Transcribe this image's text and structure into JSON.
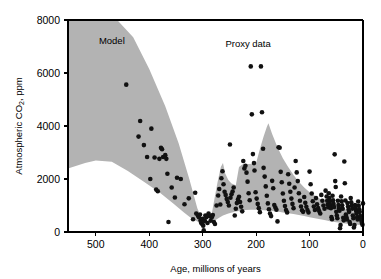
{
  "chart_data": {
    "type": "scatter",
    "title": "",
    "xlabel": "Age, millions of years",
    "ylabel_prefix": "Atmospheric CO",
    "ylabel_sub": "2",
    "ylabel_suffix": ", ppm",
    "ylabel_full": "Atmospheric CO2, ppm",
    "xlim": [
      552,
      0
    ],
    "ylim": [
      0,
      8000
    ],
    "x_reversed": true,
    "grid": false,
    "legend": "none",
    "xticks": [
      500,
      400,
      300,
      200,
      100,
      0
    ],
    "xtick_labels": [
      "500",
      "400",
      "300",
      "200",
      "100",
      "0"
    ],
    "yticks": [
      0,
      2000,
      4000,
      6000,
      8000
    ],
    "ytick_labels": [
      "0",
      "2000",
      "4000",
      "6000",
      "8000"
    ],
    "annotations": [
      {
        "name": "model-label",
        "text": "Model",
        "x": 470,
        "y": 7100
      },
      {
        "name": "proxy-label",
        "text": "Proxy data",
        "x": 215,
        "y": 7000
      }
    ],
    "colors": {
      "band_fill": "#b3b3b3",
      "point_fill": "#111111",
      "axis": "#000000",
      "background": "#ffffff"
    },
    "series": [
      {
        "name": "Model",
        "type": "band",
        "fill": "#b3b3b3",
        "upper": [
          [
            552,
            8000
          ],
          [
            500,
            8000
          ],
          [
            460,
            8000
          ],
          [
            430,
            7350
          ],
          [
            400,
            6150
          ],
          [
            370,
            4750
          ],
          [
            345,
            3350
          ],
          [
            325,
            2000
          ],
          [
            310,
            900
          ],
          [
            300,
            430
          ],
          [
            292,
            330
          ],
          [
            285,
            460
          ],
          [
            278,
            1250
          ],
          [
            272,
            1900
          ],
          [
            266,
            2450
          ],
          [
            262,
            2600
          ],
          [
            258,
            2220
          ],
          [
            252,
            1960
          ],
          [
            246,
            1830
          ],
          [
            238,
            1760
          ],
          [
            232,
            2450
          ],
          [
            226,
            2550
          ],
          [
            220,
            2560
          ],
          [
            214,
            2570
          ],
          [
            208,
            2580
          ],
          [
            200,
            2600
          ],
          [
            192,
            3200
          ],
          [
            186,
            3600
          ],
          [
            180,
            3960
          ],
          [
            177,
            4100
          ],
          [
            170,
            3700
          ],
          [
            160,
            3200
          ],
          [
            150,
            2780
          ],
          [
            140,
            2450
          ],
          [
            130,
            2150
          ],
          [
            120,
            1900
          ],
          [
            110,
            1680
          ],
          [
            100,
            1500
          ],
          [
            90,
            1370
          ],
          [
            80,
            1250
          ],
          [
            70,
            1150
          ],
          [
            60,
            1060
          ],
          [
            50,
            980
          ],
          [
            40,
            900
          ],
          [
            30,
            840
          ],
          [
            20,
            790
          ],
          [
            10,
            740
          ],
          [
            0,
            700
          ]
        ],
        "lower": [
          [
            552,
            2400
          ],
          [
            520,
            2600
          ],
          [
            500,
            2700
          ],
          [
            470,
            2650
          ],
          [
            440,
            2300
          ],
          [
            410,
            1900
          ],
          [
            380,
            1480
          ],
          [
            355,
            1080
          ],
          [
            335,
            740
          ],
          [
            320,
            500
          ],
          [
            310,
            400
          ],
          [
            300,
            330
          ],
          [
            292,
            300
          ],
          [
            285,
            330
          ],
          [
            278,
            420
          ],
          [
            270,
            530
          ],
          [
            262,
            620
          ],
          [
            252,
            700
          ],
          [
            240,
            760
          ],
          [
            230,
            800
          ],
          [
            220,
            830
          ],
          [
            210,
            840
          ],
          [
            200,
            840
          ],
          [
            190,
            830
          ],
          [
            180,
            810
          ],
          [
            170,
            790
          ],
          [
            160,
            770
          ],
          [
            150,
            740
          ],
          [
            140,
            710
          ],
          [
            130,
            680
          ],
          [
            120,
            640
          ],
          [
            110,
            600
          ],
          [
            100,
            560
          ],
          [
            90,
            520
          ],
          [
            80,
            480
          ],
          [
            70,
            440
          ],
          [
            60,
            400
          ],
          [
            50,
            370
          ],
          [
            40,
            340
          ],
          [
            30,
            310
          ],
          [
            20,
            290
          ],
          [
            10,
            270
          ],
          [
            0,
            250
          ]
        ]
      },
      {
        "name": "Proxy data",
        "type": "points",
        "marker": "circle",
        "marker_size": 4.6,
        "color": "#111111",
        "points": [
          [
            443,
            5560
          ],
          [
            417,
            4190
          ],
          [
            420,
            3600
          ],
          [
            410,
            3280
          ],
          [
            404,
            2830
          ],
          [
            398,
            2000
          ],
          [
            396,
            3900
          ],
          [
            390,
            2810
          ],
          [
            387,
            1600
          ],
          [
            384,
            1540
          ],
          [
            381,
            2760
          ],
          [
            378,
            3180
          ],
          [
            376,
            3120
          ],
          [
            374,
            2830
          ],
          [
            370,
            2900
          ],
          [
            368,
            2760
          ],
          [
            366,
            2200
          ],
          [
            364,
            380
          ],
          [
            358,
            1680
          ],
          [
            352,
            1300
          ],
          [
            348,
            2050
          ],
          [
            341,
            2000
          ],
          [
            334,
            1050
          ],
          [
            326,
            1270
          ],
          [
            318,
            480
          ],
          [
            314,
            1480
          ],
          [
            312,
            700
          ],
          [
            309,
            620
          ],
          [
            307,
            560
          ],
          [
            305,
            660
          ],
          [
            304,
            430
          ],
          [
            303,
            350
          ],
          [
            301,
            300
          ],
          [
            300,
            500
          ],
          [
            299,
            240
          ],
          [
            298,
            60
          ],
          [
            296,
            420
          ],
          [
            295,
            620
          ],
          [
            293,
            560
          ],
          [
            291,
            340
          ],
          [
            289,
            700
          ],
          [
            287,
            600
          ],
          [
            285,
            430
          ],
          [
            283,
            560
          ],
          [
            281,
            640
          ],
          [
            279,
            380
          ],
          [
            277,
            300
          ],
          [
            274,
            1000
          ],
          [
            271,
            1380
          ],
          [
            269,
            1620
          ],
          [
            267,
            1040
          ],
          [
            265,
            2030
          ],
          [
            263,
            2290
          ],
          [
            261,
            1800
          ],
          [
            259,
            1520
          ],
          [
            257,
            1400
          ],
          [
            255,
            1250
          ],
          [
            253,
            1130
          ],
          [
            251,
            1000
          ],
          [
            249,
            3300
          ],
          [
            248,
            1290
          ],
          [
            246,
            1420
          ],
          [
            244,
            1530
          ],
          [
            242,
            1680
          ],
          [
            240,
            620
          ],
          [
            238,
            880
          ],
          [
            236,
            1090
          ],
          [
            234,
            1230
          ],
          [
            232,
            1330
          ],
          [
            230,
            1130
          ],
          [
            228,
            950
          ],
          [
            226,
            780
          ],
          [
            224,
            2680
          ],
          [
            222,
            2400
          ],
          [
            220,
            2500
          ],
          [
            218,
            2240
          ],
          [
            216,
            1900
          ],
          [
            214,
            1460
          ],
          [
            212,
            1200
          ],
          [
            210,
            6250
          ],
          [
            208,
            4440
          ],
          [
            206,
            2940
          ],
          [
            204,
            2600
          ],
          [
            203,
            2320
          ],
          [
            201,
            1500
          ],
          [
            199,
            1260
          ],
          [
            197,
            1060
          ],
          [
            195,
            900
          ],
          [
            193,
            750
          ],
          [
            191,
            6250
          ],
          [
            189,
            4520
          ],
          [
            187,
            3140
          ],
          [
            186,
            2420
          ],
          [
            184,
            2090
          ],
          [
            182,
            1720
          ],
          [
            180,
            1370
          ],
          [
            178,
            1080
          ],
          [
            176,
            860
          ],
          [
            174,
            700
          ],
          [
            172,
            600
          ],
          [
            170,
            1930
          ],
          [
            168,
            1650
          ],
          [
            166,
            1020
          ],
          [
            164,
            920
          ],
          [
            162,
            840
          ],
          [
            160,
            400
          ],
          [
            158,
            3200
          ],
          [
            156,
            3180
          ],
          [
            154,
            2270
          ],
          [
            152,
            1880
          ],
          [
            150,
            1450
          ],
          [
            148,
            1180
          ],
          [
            146,
            980
          ],
          [
            144,
            830
          ],
          [
            142,
            740
          ],
          [
            140,
            2180
          ],
          [
            138,
            1820
          ],
          [
            136,
            1520
          ],
          [
            134,
            1260
          ],
          [
            132,
            1060
          ],
          [
            130,
            900
          ],
          [
            128,
            1680
          ],
          [
            126,
            2680
          ],
          [
            124,
            2250
          ],
          [
            122,
            1920
          ],
          [
            120,
            1460
          ],
          [
            118,
            1180
          ],
          [
            116,
            960
          ],
          [
            114,
            820
          ],
          [
            112,
            760
          ],
          [
            110,
            1320
          ],
          [
            108,
            1100
          ],
          [
            106,
            950
          ],
          [
            104,
            830
          ],
          [
            102,
            740
          ],
          [
            100,
            2280
          ],
          [
            98,
            1800
          ],
          [
            96,
            1450
          ],
          [
            94,
            1160
          ],
          [
            92,
            960
          ],
          [
            90,
            830
          ],
          [
            88,
            1280
          ],
          [
            86,
            1050
          ],
          [
            84,
            900
          ],
          [
            82,
            790
          ],
          [
            80,
            700
          ],
          [
            78,
            1400
          ],
          [
            76,
            1180
          ],
          [
            74,
            1000
          ],
          [
            72,
            880
          ],
          [
            70,
            1560
          ],
          [
            68,
            1340
          ],
          [
            67,
            1180
          ],
          [
            66,
            1040
          ],
          [
            65,
            930
          ],
          [
            64,
            1460
          ],
          [
            63,
            1280
          ],
          [
            62,
            1140
          ],
          [
            61,
            1020
          ],
          [
            60,
            900
          ],
          [
            59,
            560
          ],
          [
            58,
            480
          ],
          [
            57,
            1370
          ],
          [
            56,
            1200
          ],
          [
            55,
            1060
          ],
          [
            54,
            940
          ],
          [
            53,
            2930
          ],
          [
            52,
            1920
          ],
          [
            51,
            1700
          ],
          [
            50,
            760
          ],
          [
            49,
            620
          ],
          [
            48,
            520
          ],
          [
            47,
            1180
          ],
          [
            46,
            1020
          ],
          [
            45,
            900
          ],
          [
            44,
            800
          ],
          [
            43,
            140
          ],
          [
            42,
            260
          ],
          [
            41,
            1340
          ],
          [
            40,
            1160
          ],
          [
            39,
            1010
          ],
          [
            38,
            880
          ],
          [
            37,
            540
          ],
          [
            36,
            440
          ],
          [
            35,
            2660
          ],
          [
            34,
            1840
          ],
          [
            33,
            1190
          ],
          [
            32,
            660
          ],
          [
            31,
            560
          ],
          [
            30,
            470
          ],
          [
            29,
            1090
          ],
          [
            28,
            960
          ],
          [
            27,
            850
          ],
          [
            26,
            760
          ],
          [
            25,
            380
          ],
          [
            24,
            300
          ],
          [
            23,
            1280
          ],
          [
            22,
            1120
          ],
          [
            21,
            990
          ],
          [
            20,
            880
          ],
          [
            19,
            620
          ],
          [
            18,
            520
          ],
          [
            17,
            170
          ],
          [
            16,
            260
          ],
          [
            15,
            1020
          ],
          [
            14,
            900
          ],
          [
            13,
            800
          ],
          [
            12,
            710
          ],
          [
            11,
            560
          ],
          [
            10,
            470
          ],
          [
            9,
            1150
          ],
          [
            8,
            990
          ],
          [
            7,
            860
          ],
          [
            6,
            760
          ],
          [
            5,
            600
          ],
          [
            4,
            500
          ],
          [
            3,
            420
          ],
          [
            2,
            340
          ],
          [
            1,
            270
          ],
          [
            0,
            1080
          ]
        ]
      }
    ]
  }
}
